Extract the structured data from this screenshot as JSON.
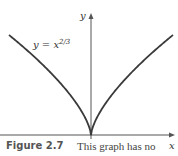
{
  "chart_data": {
    "type": "line",
    "title": "",
    "xlabel": "x",
    "ylabel": "y",
    "series": [
      {
        "name": "y = x^(2/3)",
        "label": "y = x",
        "label_exponent": "2/3",
        "x": [
          -1,
          -0.75,
          -0.5,
          -0.25,
          -0.1,
          0,
          0.1,
          0.25,
          0.5,
          0.75,
          1
        ],
        "values": [
          1,
          0.825,
          0.63,
          0.397,
          0.215,
          0,
          0.215,
          0.397,
          0.63,
          0.825,
          1
        ]
      }
    ],
    "grid": false,
    "legend": "none",
    "annotations": [
      "cusp at origin"
    ]
  },
  "axes": {
    "x_label": "x",
    "y_label": "y"
  },
  "curve_label": {
    "base": "y = x",
    "exponent": "2/3"
  },
  "caption": {
    "label": "Figure 2.7",
    "text": "This graph has no"
  },
  "colors": {
    "curve": "#3a3a3a",
    "axis": "#555555",
    "caption_label": "#555555"
  }
}
